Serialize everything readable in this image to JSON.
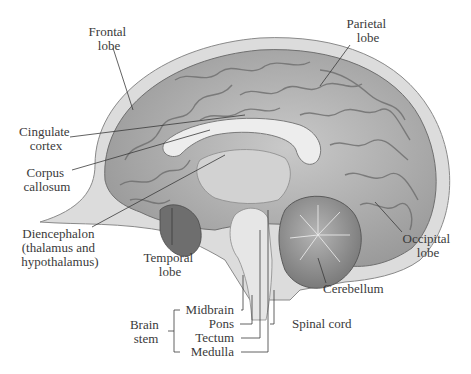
{
  "diagram": {
    "labels": {
      "frontal": [
        "Frontal",
        "lobe"
      ],
      "parietal": [
        "Parietal",
        "lobe"
      ],
      "cingulate": [
        "Cingulate",
        "cortex"
      ],
      "corpus": [
        "Corpus",
        "callosum"
      ],
      "diencephalon": [
        "Diencephalon",
        "(thalamus and",
        "hypothalamus)"
      ],
      "temporal": [
        "Temporal",
        "lobe"
      ],
      "occipital": [
        "Occipital",
        "lobe"
      ],
      "cerebellum": "Cerebellum",
      "spinal_cord": "Spinal cord",
      "brain_stem": [
        "Brain",
        "stem"
      ],
      "midbrain": "Midbrain",
      "pons": "Pons",
      "tectum": "Tectum",
      "medulla": "Medulla"
    }
  }
}
